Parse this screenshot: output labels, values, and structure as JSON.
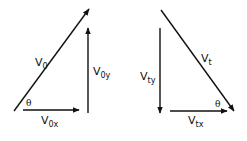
{
  "diagram": {
    "color": "#111111",
    "left": {
      "resultant": {
        "main": "V",
        "sub": "0"
      },
      "vertical": {
        "main": "V",
        "sub": "0y"
      },
      "horizontal": {
        "main": "V",
        "sub": "0x"
      },
      "angle": "θ"
    },
    "right": {
      "resultant": {
        "main": "V",
        "sub": "t"
      },
      "vertical": {
        "main": "V",
        "sub": "ty"
      },
      "horizontal": {
        "main": "V",
        "sub": "tx"
      },
      "angle": "θ"
    }
  }
}
